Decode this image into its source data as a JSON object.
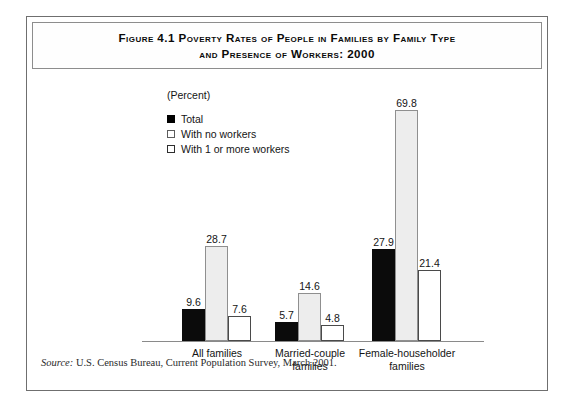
{
  "figure": {
    "title_line1": "Figure 4.1    Poverty Rates of People in Families by Family Type",
    "title_line2": "and Presence of Workers: 2000",
    "unit_label": "(Percent)",
    "source_lead": "Source:",
    "source_text": " U.S. Census Bureau, Current Population Survey, March 2001."
  },
  "legend": {
    "items": [
      {
        "label": "Total",
        "swatch": "solid-black-square",
        "color": "#0b0b0b"
      },
      {
        "label": "With no workers",
        "swatch": "hollow-gray-square",
        "color": "#ededed"
      },
      {
        "label": "With 1 or more workers",
        "swatch": "hollow-white-square",
        "color": "#ffffff"
      }
    ]
  },
  "chart_data": {
    "type": "bar",
    "title": "Figure 4.1  Poverty Rates of People in Families by Family Type and Presence of Workers: 2000",
    "xlabel": "",
    "ylabel": "Percent",
    "ylim": [
      0,
      75
    ],
    "grid": false,
    "legend_position": "upper-left",
    "categories": [
      "All families",
      "Married-couple families",
      "Female-householder families"
    ],
    "category_lines": [
      [
        "All families"
      ],
      [
        "Married-couple",
        "families"
      ],
      [
        "Female-householder",
        "families"
      ]
    ],
    "series": [
      {
        "name": "Total",
        "values": [
          9.6,
          5.7,
          27.9
        ]
      },
      {
        "name": "With no workers",
        "values": [
          28.7,
          14.6,
          69.8
        ]
      },
      {
        "name": "With 1 or more workers",
        "values": [
          7.6,
          4.8,
          21.4
        ]
      }
    ],
    "value_labels": [
      [
        "9.6",
        "28.7",
        "7.6"
      ],
      [
        "5.7",
        "14.6",
        "4.8"
      ],
      [
        "27.9",
        "69.8",
        "21.4"
      ]
    ],
    "source": "Source: U.S. Census Bureau, Current Population Survey, March 2001."
  }
}
